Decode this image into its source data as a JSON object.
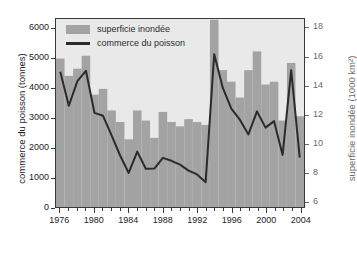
{
  "chart_data": {
    "type": "bar",
    "title": "",
    "xlabel": "",
    "ylabel": "commerce du poisson (tonnes)",
    "y2label": "superficie inondée (1000 km²)",
    "grid": false,
    "legend_position": "top-left",
    "x": [
      1976,
      1977,
      1978,
      1979,
      1980,
      1981,
      1982,
      1983,
      1984,
      1985,
      1986,
      1987,
      1988,
      1989,
      1990,
      1991,
      1992,
      1993,
      1994,
      1995,
      1996,
      1997,
      1998,
      1999,
      2000,
      2001,
      2002,
      2003,
      2004
    ],
    "categories": [
      "1976",
      "1977",
      "1978",
      "1979",
      "1980",
      "1981",
      "1982",
      "1983",
      "1984",
      "1985",
      "1986",
      "1987",
      "1988",
      "1989",
      "1990",
      "1991",
      "1992",
      "1993",
      "1994",
      "1995",
      "1996",
      "1997",
      "1998",
      "1999",
      "2000",
      "2001",
      "2002",
      "2003",
      "2004"
    ],
    "ylim": [
      0,
      6350
    ],
    "yticks": [
      0,
      1000,
      2000,
      3000,
      4000,
      5000,
      6000
    ],
    "yticklabels": [
      "0",
      "1000",
      "2000",
      "3000",
      "4000",
      "5000",
      "6000"
    ],
    "y2lim": [
      5.6,
      18.65
    ],
    "y2ticks": [
      6,
      8,
      10,
      12,
      14,
      16,
      18
    ],
    "y2ticklabels": [
      "6",
      "8",
      "10",
      "12",
      "14",
      "16",
      "18"
    ],
    "xlim": [
      1975.5,
      2004.5
    ],
    "xticks": [
      1976,
      1980,
      1984,
      1988,
      1992,
      1996,
      2000,
      2004
    ],
    "xticklabels": [
      "1976",
      "1980",
      "1984",
      "1988",
      "1992",
      "1996",
      "2000",
      "2004"
    ],
    "xminorticks_every": 1,
    "series": [
      {
        "name": "superficie inondée",
        "type": "bar",
        "axis": "right",
        "unit": "1000 km²",
        "color": "#a3a3a3",
        "values": [
          15.9,
          14.7,
          15.2,
          16.1,
          13.4,
          13.8,
          12.3,
          11.5,
          10.3,
          12.3,
          11.6,
          10.4,
          12.2,
          11.5,
          11.2,
          11.7,
          11.5,
          11.3,
          18.6,
          15.1,
          14.3,
          13.2,
          15.1,
          16.4,
          14.1,
          14.3,
          11.6,
          15.6,
          11.9
        ]
      },
      {
        "name": "commerce du poisson",
        "type": "line",
        "axis": "left",
        "unit": "tonnes",
        "color": "#2b2b2b",
        "values": [
          4570,
          3420,
          4250,
          4600,
          3180,
          3080,
          2420,
          1740,
          1150,
          1870,
          1290,
          1300,
          1660,
          1560,
          1430,
          1230,
          1100,
          840,
          5160,
          4030,
          3320,
          2950,
          2450,
          3230,
          2680,
          2900,
          1760,
          4620,
          1670
        ]
      }
    ],
    "legend": [
      {
        "label": "superficie inondée",
        "marker": "bar-swatch",
        "color": "#a3a3a3"
      },
      {
        "label": "commerce du poisson",
        "marker": "line-swatch",
        "color": "#2b2b2b"
      }
    ]
  }
}
